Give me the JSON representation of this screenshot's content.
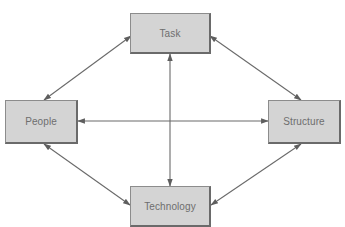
{
  "diagram": {
    "type": "relationship-diagram",
    "nodes": [
      {
        "id": "task",
        "label": "Task"
      },
      {
        "id": "people",
        "label": "People"
      },
      {
        "id": "structure",
        "label": "Structure"
      },
      {
        "id": "technology",
        "label": "Technology"
      }
    ],
    "edges": [
      {
        "from": "task",
        "to": "people",
        "direction": "bidirectional"
      },
      {
        "from": "task",
        "to": "structure",
        "direction": "bidirectional"
      },
      {
        "from": "task",
        "to": "technology",
        "direction": "bidirectional"
      },
      {
        "from": "people",
        "to": "structure",
        "direction": "bidirectional"
      },
      {
        "from": "people",
        "to": "technology",
        "direction": "bidirectional"
      },
      {
        "from": "structure",
        "to": "technology",
        "direction": "bidirectional"
      }
    ],
    "colors": {
      "box_fill": "#d4d4d4",
      "box_border": "#8c8c8c",
      "arrow": "#6a6a6a",
      "label": "#6e6e6e"
    }
  }
}
